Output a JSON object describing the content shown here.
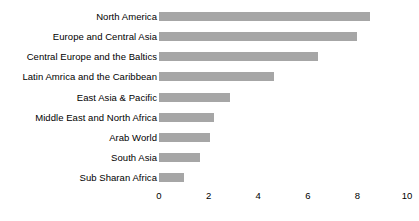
{
  "chart_data": {
    "type": "bar",
    "orientation": "horizontal",
    "title": "",
    "subtitle": "",
    "xlabel": "",
    "ylabel": "",
    "xlim": [
      0,
      10
    ],
    "ylim": null,
    "grid": false,
    "legend": null,
    "legend_position": "none",
    "bar_color": "#a6a6a6",
    "background_color": "#ffffff",
    "text_color": "#000000",
    "x_ticks": [
      0,
      2,
      4,
      6,
      8,
      10
    ],
    "x_tick_labels": [
      "0",
      "2",
      "4",
      "6",
      "8",
      "10"
    ],
    "categories": [
      "North America",
      "Europe and Central Asia",
      "Central Europe and the Baltics",
      "Latin Amrica and the Caribbean",
      "East Asia & Pacific",
      "Middle East and North Africa",
      "Arab World",
      "South Asia",
      "Sub Sharan Africa"
    ],
    "values": [
      8.5,
      8.0,
      6.4,
      4.65,
      2.85,
      2.2,
      2.05,
      1.65,
      1.0
    ],
    "series": [
      {
        "name": "",
        "values": [
          8.5,
          8.0,
          6.4,
          4.65,
          2.85,
          2.2,
          2.05,
          1.65,
          1.0
        ]
      }
    ]
  }
}
